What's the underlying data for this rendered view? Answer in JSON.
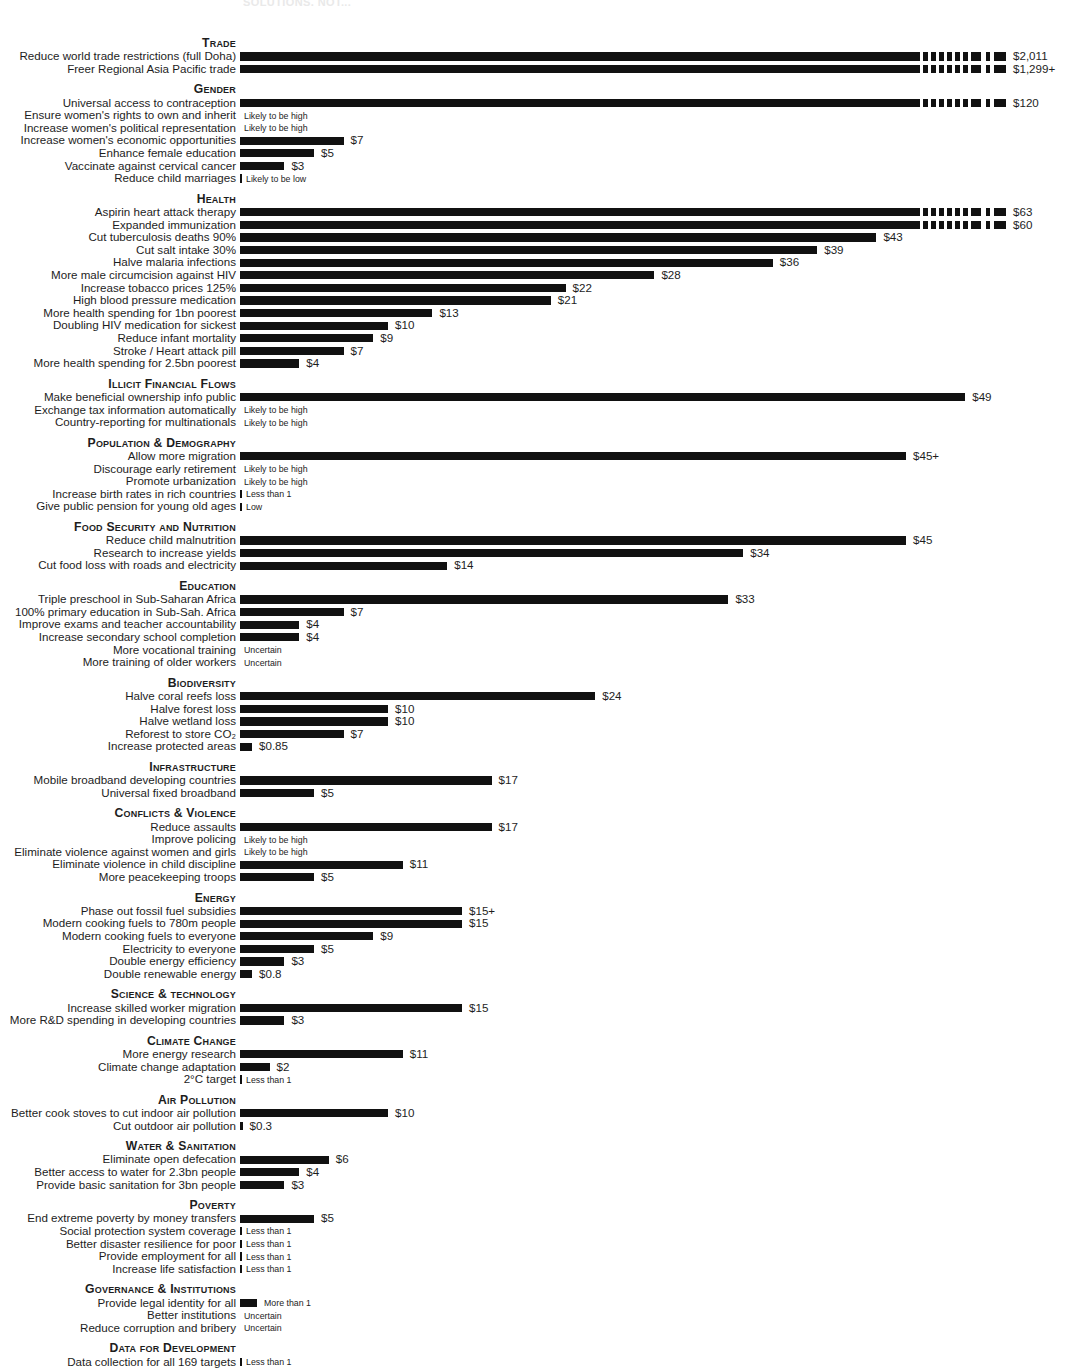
{
  "faint_header": "SOLUTIONS, NOT...",
  "axis": {
    "bar_origin_px": 240,
    "px_per_dollar": 14.8,
    "unit_note": "benefit per dollar spent"
  },
  "chart_data": {
    "type": "bar",
    "title": "",
    "xlabel": "",
    "ylabel": "",
    "orientation": "horizontal",
    "grid": false,
    "legend": null,
    "value_prefix": "$",
    "sections": [
      {
        "section": "Trade",
        "items": [
          {
            "label": "Reduce world trade restrictions (full Doha)",
            "value": 2011,
            "display": "$2,011",
            "truncated": true
          },
          {
            "label": "Freer Regional Asia Pacific trade",
            "value": 1299,
            "display": "$1,299+",
            "truncated": true
          }
        ]
      },
      {
        "section": "Gender",
        "items": [
          {
            "label": "Universal access to contraception",
            "value": 120,
            "display": "$120",
            "truncated": true
          },
          {
            "label": "Ensure women's rights to own and inherit",
            "value": null,
            "display": "",
            "note": "Likely to be high"
          },
          {
            "label": "Increase women's political representation",
            "value": null,
            "display": "",
            "note": "Likely to be high"
          },
          {
            "label": "Increase women's economic opportunities",
            "value": 7,
            "display": "$7"
          },
          {
            "label": "Enhance female education",
            "value": 5,
            "display": "$5"
          },
          {
            "label": "Vaccinate against cervical cancer",
            "value": 3,
            "display": "$3"
          },
          {
            "label": "Reduce child marriages",
            "value": null,
            "display": "",
            "note": "Likely to be low",
            "tick": true
          }
        ]
      },
      {
        "section": "Health",
        "items": [
          {
            "label": "Aspirin heart attack therapy",
            "value": 63,
            "display": "$63",
            "truncated": true
          },
          {
            "label": "Expanded immunization",
            "value": 60,
            "display": "$60",
            "truncated": true
          },
          {
            "label": "Cut tuberculosis deaths 90%",
            "value": 43,
            "display": "$43"
          },
          {
            "label": "Cut salt intake 30%",
            "value": 39,
            "display": "$39"
          },
          {
            "label": "Halve malaria infections",
            "value": 36,
            "display": "$36"
          },
          {
            "label": "More male circumcision against HIV",
            "value": 28,
            "display": "$28"
          },
          {
            "label": "Increase tobacco prices 125%",
            "value": 22,
            "display": "$22"
          },
          {
            "label": "High blood pressure medication",
            "value": 21,
            "display": "$21"
          },
          {
            "label": "More health spending for 1bn poorest",
            "value": 13,
            "display": "$13"
          },
          {
            "label": "Doubling HIV medication for sickest",
            "value": 10,
            "display": "$10"
          },
          {
            "label": "Reduce infant mortality",
            "value": 9,
            "display": "$9"
          },
          {
            "label": "Stroke / Heart attack pill",
            "value": 7,
            "display": "$7"
          },
          {
            "label": "More health spending for 2.5bn poorest",
            "value": 4,
            "display": "$4"
          }
        ]
      },
      {
        "section": "Illicit Financial Flows",
        "items": [
          {
            "label": "Make beneficial ownership info public",
            "value": 49,
            "display": "$49"
          },
          {
            "label": "Exchange tax information automatically",
            "value": null,
            "display": "",
            "note": "Likely to be high"
          },
          {
            "label": "Country-reporting for multinationals",
            "value": null,
            "display": "",
            "note": "Likely to be high"
          }
        ]
      },
      {
        "section": "Population & Demography",
        "items": [
          {
            "label": "Allow more migration",
            "value": 45,
            "display": "$45+"
          },
          {
            "label": "Discourage early retirement",
            "value": null,
            "display": "",
            "note": "Likely to be high"
          },
          {
            "label": "Promote urbanization",
            "value": null,
            "display": "",
            "note": "Likely to be high"
          },
          {
            "label": "Increase birth rates in rich countries",
            "value": null,
            "display": "",
            "note": "Less than 1",
            "tick": true
          },
          {
            "label": "Give public pension for young old ages",
            "value": null,
            "display": "",
            "note": "Low",
            "tick": true
          }
        ]
      },
      {
        "section": "Food Security and Nutrition",
        "items": [
          {
            "label": "Reduce child malnutrition",
            "value": 45,
            "display": "$45"
          },
          {
            "label": "Research to increase yields",
            "value": 34,
            "display": "$34"
          },
          {
            "label": "Cut food loss with roads and electricity",
            "value": 14,
            "display": "$14"
          }
        ]
      },
      {
        "section": "Education",
        "items": [
          {
            "label": "Triple preschool in Sub-Saharan Africa",
            "value": 33,
            "display": "$33"
          },
          {
            "label": "100% primary education in Sub-Sah. Africa",
            "value": 7,
            "display": "$7"
          },
          {
            "label": "Improve exams and teacher accountability",
            "value": 4,
            "display": "$4"
          },
          {
            "label": "Increase secondary school completion",
            "value": 4,
            "display": "$4"
          },
          {
            "label": "More vocational training",
            "value": null,
            "display": "",
            "note": "Uncertain"
          },
          {
            "label": "More training of older workers",
            "value": null,
            "display": "",
            "note": "Uncertain"
          }
        ]
      },
      {
        "section": "Biodiversity",
        "items": [
          {
            "label": "Halve coral reefs loss",
            "value": 24,
            "display": "$24"
          },
          {
            "label": "Halve forest loss",
            "value": 10,
            "display": "$10"
          },
          {
            "label": "Halve wetland loss",
            "value": 10,
            "display": "$10"
          },
          {
            "label": "Reforest to store CO₂",
            "value": 7,
            "display": "$7"
          },
          {
            "label": "Increase protected areas",
            "value": 0.85,
            "display": "$0.85"
          }
        ]
      },
      {
        "section": "Infrastructure",
        "items": [
          {
            "label": "Mobile broadband developing countries",
            "value": 17,
            "display": "$17"
          },
          {
            "label": "Universal fixed broadband",
            "value": 5,
            "display": "$5"
          }
        ]
      },
      {
        "section": "Conflicts & Violence",
        "items": [
          {
            "label": "Reduce assaults",
            "value": 17,
            "display": "$17"
          },
          {
            "label": "Improve policing",
            "value": null,
            "display": "",
            "note": "Likely to be high"
          },
          {
            "label": "Eliminate violence against women and girls",
            "value": null,
            "display": "",
            "note": "Likely to be high"
          },
          {
            "label": "Eliminate violence in child discipline",
            "value": 11,
            "display": "$11"
          },
          {
            "label": "More peacekeeping troops",
            "value": 5,
            "display": "$5"
          }
        ]
      },
      {
        "section": "Energy",
        "items": [
          {
            "label": "Phase out fossil fuel subsidies",
            "value": 15,
            "display": "$15+"
          },
          {
            "label": "Modern cooking fuels to 780m people",
            "value": 15,
            "display": "$15"
          },
          {
            "label": "Modern cooking fuels to everyone",
            "value": 9,
            "display": "$9"
          },
          {
            "label": "Electricity to everyone",
            "value": 5,
            "display": "$5"
          },
          {
            "label": "Double energy efficiency",
            "value": 3,
            "display": "$3"
          },
          {
            "label": "Double renewable energy",
            "value": 0.8,
            "display": "$0.8"
          }
        ]
      },
      {
        "section": "Science & technology",
        "items": [
          {
            "label": "Increase skilled worker migration",
            "value": 15,
            "display": "$15"
          },
          {
            "label": "More R&D spending in developing countries",
            "value": 3,
            "display": "$3"
          }
        ]
      },
      {
        "section": "Climate Change",
        "items": [
          {
            "label": "More energy research",
            "value": 11,
            "display": "$11"
          },
          {
            "label": "Climate change adaptation",
            "value": 2,
            "display": "$2"
          },
          {
            "label": "2°C target",
            "value": null,
            "display": "",
            "note": "Less than 1",
            "tick": true
          }
        ]
      },
      {
        "section": "Air Pollution",
        "items": [
          {
            "label": "Better cook stoves to cut indoor air pollution",
            "value": 10,
            "display": "$10"
          },
          {
            "label": "Cut outdoor air pollution",
            "value": 0.3,
            "display": "$0.3",
            "tick": true
          }
        ]
      },
      {
        "section": "Water & Sanitation",
        "items": [
          {
            "label": "Eliminate open defecation",
            "value": 6,
            "display": "$6"
          },
          {
            "label": "Better access to water for 2.3bn people",
            "value": 4,
            "display": "$4"
          },
          {
            "label": "Provide basic sanitation for 3bn people",
            "value": 3,
            "display": "$3"
          }
        ]
      },
      {
        "section": "Poverty",
        "items": [
          {
            "label": "End extreme poverty by money transfers",
            "value": 5,
            "display": "$5"
          },
          {
            "label": "Social protection system coverage",
            "value": null,
            "display": "",
            "note": "Less than 1",
            "tick": true
          },
          {
            "label": "Better disaster resilience for poor",
            "value": null,
            "display": "",
            "note": "Less than 1",
            "tick": true
          },
          {
            "label": "Provide employment for all",
            "value": null,
            "display": "",
            "note": "Less than 1",
            "tick": true
          },
          {
            "label": "Increase life satisfaction",
            "value": null,
            "display": "",
            "note": "Less than 1",
            "tick": true
          }
        ]
      },
      {
        "section": "Governance & Institutions",
        "items": [
          {
            "label": "Provide legal identity for all",
            "value": 1.2,
            "display": "",
            "note": "More than 1",
            "tick": true
          },
          {
            "label": "Better institutions",
            "value": null,
            "display": "",
            "note": "Uncertain"
          },
          {
            "label": "Reduce corruption and bribery",
            "value": null,
            "display": "",
            "note": "Uncertain"
          }
        ]
      },
      {
        "section": "Data for Development",
        "items": [
          {
            "label": "Data collection for all 169 targets",
            "value": null,
            "display": "",
            "note": "Less than 1",
            "tick": true
          }
        ]
      }
    ]
  }
}
